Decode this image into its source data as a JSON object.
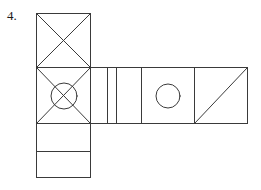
{
  "figure": {
    "item_number": "4.",
    "stroke_color": "#3a3a3a",
    "fill_color": "none",
    "background_color": "#ffffff",
    "stroke_width": 1
  },
  "panels": [
    {
      "name": "top-square-with-x",
      "shape": "square",
      "x": 36,
      "y": 13,
      "width": 55,
      "height": 55,
      "marking": "x-diagonals"
    },
    {
      "name": "center-square-with-x-and-circle",
      "shape": "square",
      "x": 36,
      "y": 68,
      "width": 55,
      "height": 56,
      "marking": "x-diagonals-with-center-circle",
      "circle": {
        "cx": 64,
        "cy": 96,
        "r": 13
      }
    },
    {
      "name": "lower-rectangle-upper",
      "shape": "rectangle",
      "x": 36,
      "y": 124,
      "width": 55,
      "height": 28,
      "marking": "blank"
    },
    {
      "name": "lower-rectangle-bottom",
      "shape": "rectangle",
      "x": 36,
      "y": 152,
      "width": 55,
      "height": 26,
      "marking": "blank"
    },
    {
      "name": "narrow-strip-left",
      "shape": "rectangle",
      "x": 91,
      "y": 68,
      "width": 17,
      "height": 56,
      "marking": "blank"
    },
    {
      "name": "narrow-strip-right",
      "shape": "rectangle",
      "x": 108,
      "y": 68,
      "width": 9,
      "height": 56,
      "marking": "blank"
    },
    {
      "name": "wide-strip",
      "shape": "rectangle",
      "x": 117,
      "y": 68,
      "width": 25,
      "height": 56,
      "marking": "blank"
    },
    {
      "name": "square-with-circle",
      "shape": "square",
      "x": 142,
      "y": 68,
      "width": 53,
      "height": 56,
      "marking": "center-circle",
      "circle": {
        "cx": 168,
        "cy": 96,
        "r": 12
      }
    },
    {
      "name": "square-with-diagonal",
      "shape": "square",
      "x": 195,
      "y": 68,
      "width": 53,
      "height": 56,
      "marking": "diagonal-bottom-left-to-top-right"
    }
  ],
  "geometry": {
    "outline_path": "M36,13 L91,13 L91,68 L248,68 L248,124 L91,124 L91,178 L36,178 Z",
    "vertical_dividers": [
      {
        "name": "divider-x91",
        "x": 91,
        "y1": 68,
        "y2": 124
      },
      {
        "name": "divider-x108",
        "x": 108,
        "y1": 68,
        "y2": 124
      },
      {
        "name": "divider-x117",
        "x": 117,
        "y1": 68,
        "y2": 124
      },
      {
        "name": "divider-x142",
        "x": 142,
        "y1": 68,
        "y2": 124
      },
      {
        "name": "divider-x195",
        "x": 195,
        "y1": 68,
        "y2": 124
      }
    ],
    "horizontal_dividers": [
      {
        "name": "divider-y68",
        "y": 68,
        "x1": 36,
        "x2": 91
      },
      {
        "name": "divider-y124",
        "y": 124,
        "x1": 36,
        "x2": 91
      },
      {
        "name": "divider-y152",
        "y": 152,
        "x1": 36,
        "x2": 91
      }
    ],
    "diagonals": [
      {
        "name": "top-square-diagonal-a",
        "x1": 36,
        "y1": 13,
        "x2": 91,
        "y2": 68
      },
      {
        "name": "top-square-diagonal-b",
        "x1": 91,
        "y1": 13,
        "x2": 36,
        "y2": 68
      },
      {
        "name": "center-square-diagonal-a",
        "x1": 36,
        "y1": 68,
        "x2": 91,
        "y2": 124
      },
      {
        "name": "center-square-diagonal-b",
        "x1": 91,
        "y1": 68,
        "x2": 36,
        "y2": 124
      },
      {
        "name": "right-square-diagonal",
        "x1": 195,
        "y1": 124,
        "x2": 248,
        "y2": 68
      }
    ]
  }
}
